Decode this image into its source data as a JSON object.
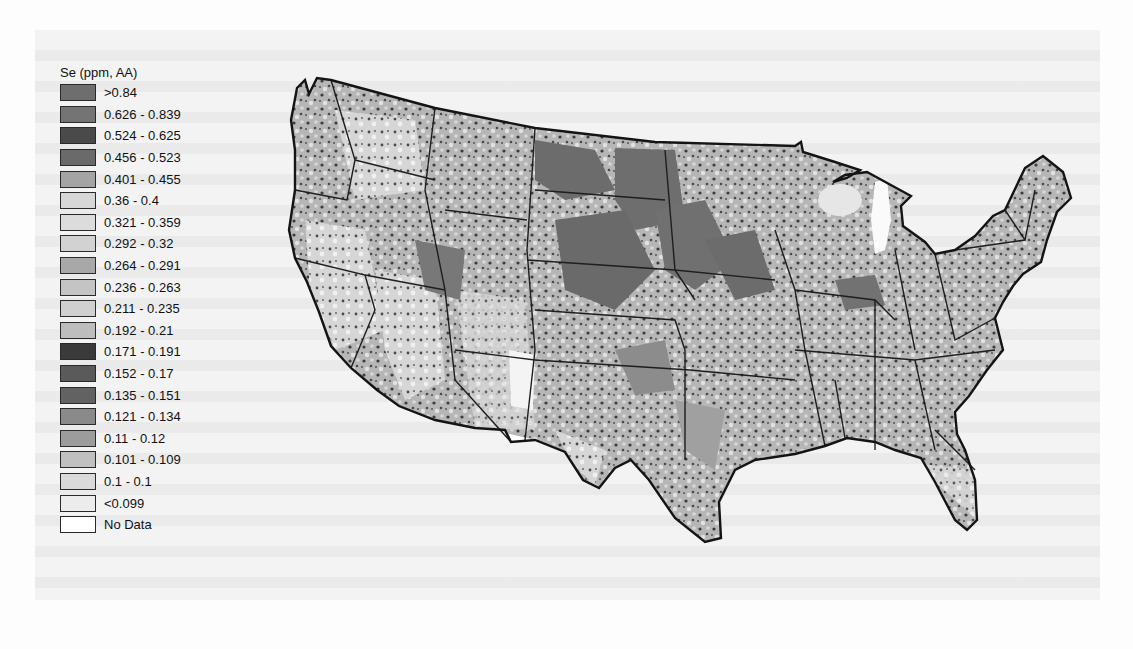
{
  "figure": {
    "type": "choropleth-map",
    "region": "Contiguous United States"
  },
  "legend": {
    "title": "Se (ppm, AA)",
    "items": [
      {
        "label": ">0.84",
        "color": "#6e6e6e"
      },
      {
        "label": "0.626 - 0.839",
        "color": "#747474"
      },
      {
        "label": "0.524 - 0.625",
        "color": "#4a4a4a"
      },
      {
        "label": "0.456 - 0.523",
        "color": "#6a6a6a"
      },
      {
        "label": "0.401 - 0.455",
        "color": "#a4a4a4"
      },
      {
        "label": "0.36 - 0.4",
        "color": "#d6d6d6"
      },
      {
        "label": "0.321 - 0.359",
        "color": "#dcdcdc"
      },
      {
        "label": "0.292 - 0.32",
        "color": "#d2d2d2"
      },
      {
        "label": "0.264 - 0.291",
        "color": "#a8a8a8"
      },
      {
        "label": "0.236 - 0.263",
        "color": "#c4c4c4"
      },
      {
        "label": "0.211 - 0.235",
        "color": "#d0d0d0"
      },
      {
        "label": "0.192 - 0.21",
        "color": "#bdbdbd"
      },
      {
        "label": "0.171 - 0.191",
        "color": "#3a3a3a"
      },
      {
        "label": "0.152 - 0.17",
        "color": "#5a5a5a"
      },
      {
        "label": "0.135 - 0.151",
        "color": "#626262"
      },
      {
        "label": "0.121 - 0.134",
        "color": "#8a8a8a"
      },
      {
        "label": "0.11 - 0.12",
        "color": "#9c9c9c"
      },
      {
        "label": "0.101 - 0.109",
        "color": "#c0c0c0"
      },
      {
        "label": "0.1 - 0.1",
        "color": "#dadada"
      },
      {
        "label": "<0.099",
        "color": "#ececec"
      },
      {
        "label": "No Data",
        "color": "#ffffff"
      }
    ]
  },
  "colors": {
    "background": "#fdfdfd",
    "map_border": "#1a1a1a",
    "land_base": "#b4b4b4",
    "high_zone": "#6c6c6c",
    "low_zone": "#e4e4e4"
  }
}
